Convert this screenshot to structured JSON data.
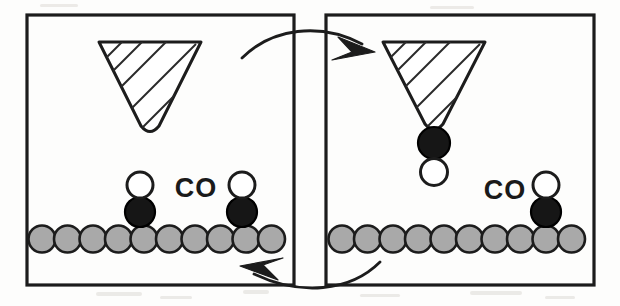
{
  "figure": {
    "kind": "two-panel schematic",
    "background_color": "#fdfdfc",
    "ink_color": "#1c1c1c"
  },
  "colors": {
    "substrate_atom_fill": "#a9a9a9",
    "carbon_fill": "#161616",
    "oxygen_fill": "#ffffff",
    "outline": "#1c1c1c",
    "tip_fill": "#ffffff"
  },
  "panels": [
    {
      "id": "panel-left",
      "name": "before-pickup",
      "frame": {
        "x": 27,
        "y": 15,
        "width": 267,
        "height": 270
      },
      "tip": {
        "name": "scanning-probe-tip",
        "apex_x": 150,
        "apex_y": 130,
        "top_y": 42,
        "half_width": 51,
        "hatched": true,
        "carries_molecule": false
      },
      "label": {
        "text": "CO",
        "x": 196,
        "y": 190
      },
      "substrate": {
        "atom_count": 10,
        "radius": 13.5,
        "spacing": 25.5,
        "first_center_x": 42,
        "center_y": 239
      },
      "molecules": [
        {
          "name": "co-adsorbed-left",
          "orientation": "carbon-down",
          "carbon_x": 140,
          "carbon_y": 212,
          "oxygen_x": 140,
          "oxygen_y": 185
        },
        {
          "name": "co-adsorbed-right",
          "orientation": "carbon-down",
          "carbon_x": 242,
          "carbon_y": 212,
          "oxygen_x": 242,
          "oxygen_y": 185
        }
      ]
    },
    {
      "id": "panel-right",
      "name": "after-pickup",
      "frame": {
        "x": 326,
        "y": 15,
        "width": 268,
        "height": 270
      },
      "tip": {
        "name": "scanning-probe-tip",
        "apex_x": 434,
        "apex_y": 128,
        "top_y": 42,
        "half_width": 51,
        "hatched": true,
        "carries_molecule": true
      },
      "label": {
        "text": "CO",
        "x": 505,
        "y": 192
      },
      "substrate": {
        "atom_count": 10,
        "radius": 13.5,
        "spacing": 25.5,
        "first_center_x": 342,
        "center_y": 239
      },
      "molecules": [
        {
          "name": "co-on-tip",
          "orientation": "carbon-up",
          "carbon_x": 434,
          "carbon_y": 143,
          "oxygen_x": 434,
          "oxygen_y": 170
        },
        {
          "name": "co-adsorbed-right",
          "orientation": "carbon-down",
          "carbon_x": 546,
          "carbon_y": 212,
          "oxygen_x": 546,
          "oxygen_y": 185
        }
      ]
    }
  ],
  "flow_arrows": [
    {
      "name": "arrow-pickup-forward",
      "direction": "left-panel-to-right-panel",
      "position": "top",
      "path": "M 246 56 Q 300 28 370 52",
      "head_points": "372,56 340,40 352,62 334,68"
    },
    {
      "name": "arrow-release-return",
      "direction": "right-panel-to-left-panel",
      "position": "bottom",
      "path": "M 382 264 Q 312 292 240 262",
      "head_points": "236,258 268,268 254,276 272,288"
    }
  ],
  "labels": {
    "co_text": "CO"
  }
}
